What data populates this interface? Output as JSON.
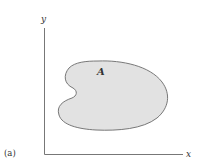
{
  "figure": {
    "panel_label": "(a)",
    "region_label": "A",
    "x_axis_label": "x",
    "y_axis_label": "y",
    "colors": {
      "axis": "#777777",
      "region_fill": "#e2e2e2",
      "region_stroke": "#6a6a6a",
      "text": "#333333"
    }
  }
}
